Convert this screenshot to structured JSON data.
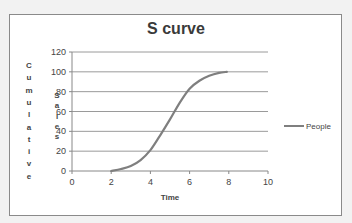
{
  "chart_data": {
    "type": "line",
    "title": "S curve",
    "xlabel": "Time",
    "ylabel": "Cumulative Sales",
    "ylabel_parts": [
      "Cumulative",
      "Sales"
    ],
    "xlim": [
      0,
      10
    ],
    "ylim": [
      0,
      120
    ],
    "xticks": [
      0,
      2,
      4,
      6,
      8,
      10
    ],
    "yticks": [
      0,
      20,
      40,
      60,
      80,
      100,
      120
    ],
    "grid": "horizontal",
    "legend_position": "right",
    "series": [
      {
        "name": "People",
        "color": "#7f7f7f",
        "x": [
          2.0,
          2.5,
          3.0,
          3.5,
          4.0,
          4.5,
          5.0,
          5.5,
          6.0,
          6.5,
          7.0,
          7.5,
          7.9
        ],
        "y": [
          0,
          2,
          5,
          11,
          21,
          36,
          52,
          69,
          83,
          91,
          96,
          99,
          100
        ]
      }
    ]
  }
}
